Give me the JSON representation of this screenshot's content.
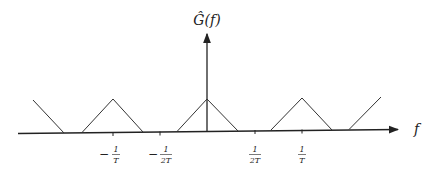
{
  "diagram": {
    "type": "periodic-spectrum",
    "y_axis_label": "Ĝ(f)",
    "x_axis_label": "f",
    "ticks": [
      {
        "name": "tick-minus-1-over-T",
        "sign": "−",
        "num": "1",
        "den": "T",
        "x": 113
      },
      {
        "name": "tick-minus-1-over-2T",
        "sign": "−",
        "num": "1",
        "den": "2T",
        "x": 160
      },
      {
        "name": "tick-1-over-2T",
        "sign": "",
        "num": "1",
        "den": "2T",
        "x": 255
      },
      {
        "name": "tick-1-over-T",
        "sign": "",
        "num": "1",
        "den": "T",
        "x": 302
      }
    ],
    "colors": {
      "line": "#222222",
      "background": "#ffffff"
    }
  }
}
